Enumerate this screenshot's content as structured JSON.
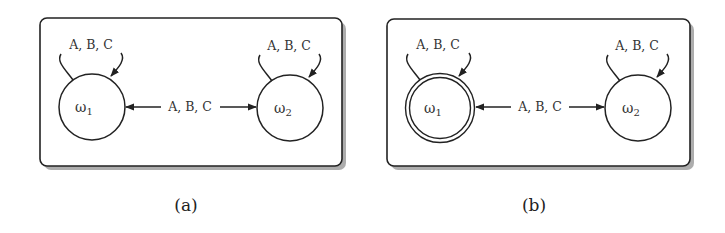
{
  "colors": {
    "stroke": "#222222",
    "text": "#333333",
    "shadow": "#8a8a8a",
    "panel_bg": "#ffffff"
  },
  "panels": [
    {
      "id": "a",
      "caption": "(a)",
      "box": {
        "x": 40,
        "y": 18,
        "w": 302,
        "h": 148,
        "r": 7
      },
      "states": [
        {
          "id": "w1",
          "symbol": "ω",
          "subscript": "1",
          "cx": 92,
          "cy": 107,
          "r": 33,
          "accepting": false,
          "self_loop_label": "A, B, C"
        },
        {
          "id": "w2",
          "symbol": "ω",
          "subscript": "2",
          "cx": 290,
          "cy": 108,
          "r": 33,
          "accepting": false,
          "self_loop_label": "A, B, C"
        }
      ],
      "edge": {
        "label": "A, B, C",
        "bidirectional": true
      }
    },
    {
      "id": "b",
      "caption": "(b)",
      "box": {
        "x": 387,
        "y": 19,
        "w": 303,
        "h": 147,
        "r": 7
      },
      "states": [
        {
          "id": "w1",
          "symbol": "ω",
          "subscript": "1",
          "cx": 440,
          "cy": 108,
          "r": 34,
          "accepting": true,
          "self_loop_label": "A, B, C"
        },
        {
          "id": "w2",
          "symbol": "ω",
          "subscript": "2",
          "cx": 638,
          "cy": 108,
          "r": 33,
          "accepting": false,
          "self_loop_label": "A, B, C"
        }
      ],
      "edge": {
        "label": "A, B, C",
        "bidirectional": true
      }
    }
  ]
}
